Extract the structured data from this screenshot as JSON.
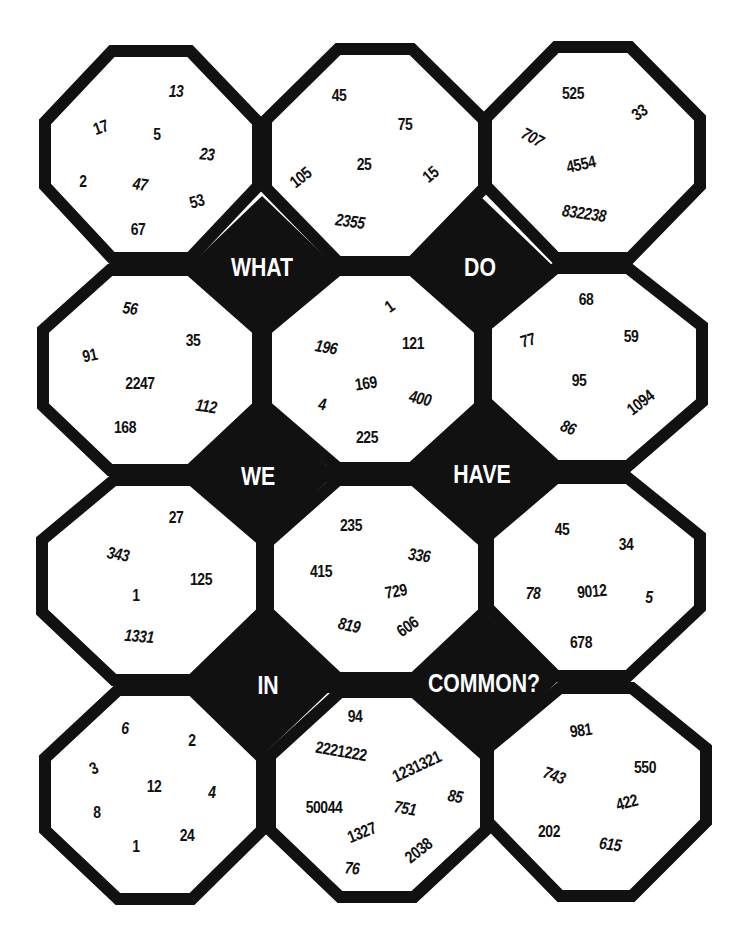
{
  "puzzle": {
    "words": [
      {
        "text": "WHAT",
        "x": 262,
        "y": 267
      },
      {
        "text": "DO",
        "x": 480,
        "y": 267
      },
      {
        "text": "WE",
        "x": 258,
        "y": 476
      },
      {
        "text": "HAVE",
        "x": 482,
        "y": 474
      },
      {
        "text": "IN",
        "x": 268,
        "y": 685
      },
      {
        "text": "COMMON?",
        "x": 484,
        "y": 683
      }
    ],
    "cells": [
      {
        "id": "r0c0",
        "numbers": [
          {
            "v": "13",
            "x": 176,
            "y": 92,
            "r": 0,
            "i": true
          },
          {
            "v": "17",
            "x": 101,
            "y": 128,
            "r": -20,
            "i": false
          },
          {
            "v": "5",
            "x": 157,
            "y": 135,
            "r": 0,
            "i": false
          },
          {
            "v": "23",
            "x": 207,
            "y": 155,
            "r": 5,
            "i": true
          },
          {
            "v": "2",
            "x": 83,
            "y": 182,
            "r": 0,
            "i": false
          },
          {
            "v": "47",
            "x": 140,
            "y": 185,
            "r": 8,
            "i": true
          },
          {
            "v": "53",
            "x": 197,
            "y": 202,
            "r": -15,
            "i": false
          },
          {
            "v": "67",
            "x": 138,
            "y": 230,
            "r": 0,
            "i": false
          }
        ]
      },
      {
        "id": "r0c1",
        "numbers": [
          {
            "v": "45",
            "x": 339,
            "y": 96,
            "r": 0,
            "i": false
          },
          {
            "v": "75",
            "x": 405,
            "y": 125,
            "r": 0,
            "i": false
          },
          {
            "v": "105",
            "x": 301,
            "y": 178,
            "r": -38,
            "i": false
          },
          {
            "v": "25",
            "x": 364,
            "y": 165,
            "r": 0,
            "i": false
          },
          {
            "v": "15",
            "x": 431,
            "y": 175,
            "r": -40,
            "i": false
          },
          {
            "v": "2355",
            "x": 350,
            "y": 222,
            "r": 8,
            "i": true
          }
        ]
      },
      {
        "id": "r0c2",
        "numbers": [
          {
            "v": "525",
            "x": 573,
            "y": 94,
            "r": 0,
            "i": false
          },
          {
            "v": "33",
            "x": 640,
            "y": 113,
            "r": -35,
            "i": false
          },
          {
            "v": "707",
            "x": 532,
            "y": 138,
            "r": 28,
            "i": true
          },
          {
            "v": "4554",
            "x": 581,
            "y": 165,
            "r": -12,
            "i": false
          },
          {
            "v": "832238",
            "x": 584,
            "y": 214,
            "r": 8,
            "i": true
          }
        ]
      },
      {
        "id": "r1c0",
        "numbers": [
          {
            "v": "56",
            "x": 130,
            "y": 309,
            "r": 8,
            "i": true
          },
          {
            "v": "91",
            "x": 90,
            "y": 356,
            "r": -12,
            "i": false
          },
          {
            "v": "35",
            "x": 193,
            "y": 341,
            "r": 0,
            "i": false
          },
          {
            "v": "2247",
            "x": 140,
            "y": 384,
            "r": 0,
            "i": false
          },
          {
            "v": "112",
            "x": 206,
            "y": 407,
            "r": 8,
            "i": true
          },
          {
            "v": "168",
            "x": 125,
            "y": 428,
            "r": 0,
            "i": false
          }
        ]
      },
      {
        "id": "r1c1",
        "numbers": [
          {
            "v": "1",
            "x": 390,
            "y": 307,
            "r": -35,
            "i": false
          },
          {
            "v": "196",
            "x": 326,
            "y": 348,
            "r": 10,
            "i": true
          },
          {
            "v": "121",
            "x": 413,
            "y": 344,
            "r": 0,
            "i": false
          },
          {
            "v": "169",
            "x": 366,
            "y": 384,
            "r": -8,
            "i": false
          },
          {
            "v": "400",
            "x": 420,
            "y": 399,
            "r": 12,
            "i": true
          },
          {
            "v": "4",
            "x": 322,
            "y": 405,
            "r": 8,
            "i": true
          },
          {
            "v": "225",
            "x": 367,
            "y": 438,
            "r": 0,
            "i": false
          }
        ]
      },
      {
        "id": "r1c2",
        "numbers": [
          {
            "v": "68",
            "x": 586,
            "y": 300,
            "r": 0,
            "i": false
          },
          {
            "v": "77",
            "x": 528,
            "y": 341,
            "r": -15,
            "i": false
          },
          {
            "v": "59",
            "x": 631,
            "y": 337,
            "r": 0,
            "i": false
          },
          {
            "v": "95",
            "x": 579,
            "y": 381,
            "r": 0,
            "i": false
          },
          {
            "v": "1094",
            "x": 641,
            "y": 403,
            "r": -38,
            "i": false
          },
          {
            "v": "86",
            "x": 568,
            "y": 428,
            "r": 22,
            "i": true
          }
        ]
      },
      {
        "id": "r2c0",
        "numbers": [
          {
            "v": "27",
            "x": 176,
            "y": 518,
            "r": 0,
            "i": false
          },
          {
            "v": "343",
            "x": 118,
            "y": 555,
            "r": 10,
            "i": true
          },
          {
            "v": "125",
            "x": 201,
            "y": 580,
            "r": 0,
            "i": false
          },
          {
            "v": "1",
            "x": 136,
            "y": 596,
            "r": 0,
            "i": false
          },
          {
            "v": "1331",
            "x": 139,
            "y": 637,
            "r": 5,
            "i": true
          }
        ]
      },
      {
        "id": "r2c1",
        "numbers": [
          {
            "v": "235",
            "x": 351,
            "y": 526,
            "r": 0,
            "i": false
          },
          {
            "v": "336",
            "x": 419,
            "y": 556,
            "r": 8,
            "i": true
          },
          {
            "v": "415",
            "x": 321,
            "y": 572,
            "r": 0,
            "i": false
          },
          {
            "v": "729",
            "x": 396,
            "y": 592,
            "r": -10,
            "i": false
          },
          {
            "v": "819",
            "x": 349,
            "y": 626,
            "r": 12,
            "i": true
          },
          {
            "v": "606",
            "x": 408,
            "y": 627,
            "r": -35,
            "i": false
          }
        ]
      },
      {
        "id": "r2c2",
        "numbers": [
          {
            "v": "45",
            "x": 562,
            "y": 530,
            "r": 0,
            "i": false
          },
          {
            "v": "34",
            "x": 626,
            "y": 545,
            "r": 0,
            "i": false
          },
          {
            "v": "78",
            "x": 533,
            "y": 594,
            "r": 0,
            "i": true
          },
          {
            "v": "9012",
            "x": 592,
            "y": 592,
            "r": -5,
            "i": false
          },
          {
            "v": "5",
            "x": 649,
            "y": 598,
            "r": 0,
            "i": true
          },
          {
            "v": "678",
            "x": 581,
            "y": 643,
            "r": 0,
            "i": false
          }
        ]
      },
      {
        "id": "r3c0",
        "numbers": [
          {
            "v": "6",
            "x": 125,
            "y": 729,
            "r": 0,
            "i": true
          },
          {
            "v": "2",
            "x": 192,
            "y": 741,
            "r": 0,
            "i": false
          },
          {
            "v": "3",
            "x": 94,
            "y": 769,
            "r": -25,
            "i": false
          },
          {
            "v": "12",
            "x": 154,
            "y": 787,
            "r": 0,
            "i": false
          },
          {
            "v": "4",
            "x": 212,
            "y": 793,
            "r": 0,
            "i": true
          },
          {
            "v": "8",
            "x": 97,
            "y": 813,
            "r": 0,
            "i": false
          },
          {
            "v": "24",
            "x": 187,
            "y": 836,
            "r": 0,
            "i": false
          },
          {
            "v": "1",
            "x": 136,
            "y": 847,
            "r": 0,
            "i": false
          }
        ]
      },
      {
        "id": "r3c1",
        "numbers": [
          {
            "v": "94",
            "x": 355,
            "y": 717,
            "r": 0,
            "i": false
          },
          {
            "v": "2221222",
            "x": 341,
            "y": 752,
            "r": 10,
            "i": false
          },
          {
            "v": "1231321",
            "x": 417,
            "y": 767,
            "r": -25,
            "i": false
          },
          {
            "v": "85",
            "x": 455,
            "y": 797,
            "r": 10,
            "i": true
          },
          {
            "v": "50044",
            "x": 324,
            "y": 808,
            "r": 0,
            "i": false
          },
          {
            "v": "751",
            "x": 405,
            "y": 809,
            "r": 10,
            "i": true
          },
          {
            "v": "1327",
            "x": 362,
            "y": 833,
            "r": -22,
            "i": false
          },
          {
            "v": "2038",
            "x": 419,
            "y": 851,
            "r": -38,
            "i": false
          },
          {
            "v": "76",
            "x": 352,
            "y": 869,
            "r": 5,
            "i": true
          }
        ]
      },
      {
        "id": "r3c2",
        "numbers": [
          {
            "v": "981",
            "x": 581,
            "y": 731,
            "r": -8,
            "i": false
          },
          {
            "v": "743",
            "x": 554,
            "y": 776,
            "r": 20,
            "i": true
          },
          {
            "v": "550",
            "x": 645,
            "y": 768,
            "r": 0,
            "i": false
          },
          {
            "v": "422",
            "x": 627,
            "y": 803,
            "r": -15,
            "i": false
          },
          {
            "v": "202",
            "x": 549,
            "y": 832,
            "r": 0,
            "i": false
          },
          {
            "v": "615",
            "x": 610,
            "y": 845,
            "r": 8,
            "i": true
          }
        ]
      }
    ]
  },
  "colors": {
    "ink": "#111111",
    "paper": "#ffffff",
    "word_text": "#ffffff"
  }
}
